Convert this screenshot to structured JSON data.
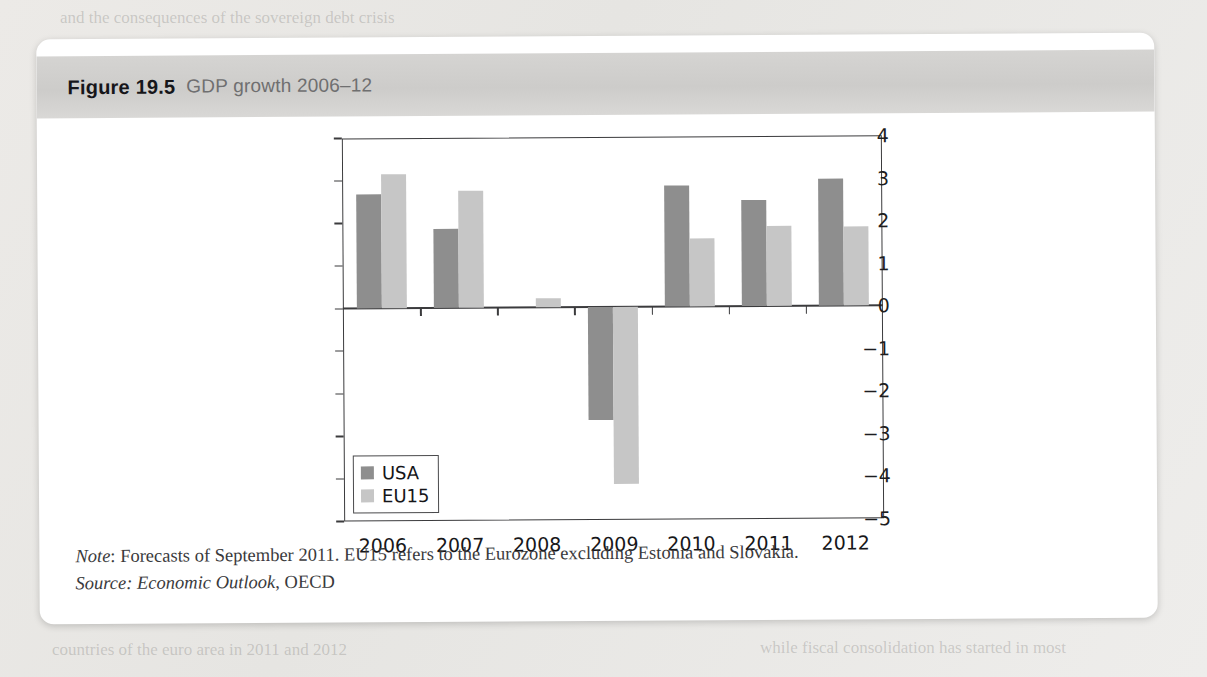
{
  "figure": {
    "number": "Figure 19.5",
    "caption": "GDP growth 2006–12"
  },
  "notes": {
    "note_label": "Note",
    "note_text": ": Forecasts of September 2011. EU15 refers to the Eurozone excluding Estonia and Slovakia.",
    "source_label": "Source",
    "source_text_italic": ": Economic Outlook",
    "source_text_plain": ", OECD"
  },
  "colors": {
    "usa": "#8e8e8e",
    "eu15": "#c6c6c6",
    "axis": "#3b3b3d",
    "header_band": "#d3d2d0",
    "card": "#ffffff",
    "page": "#e9e8e6"
  },
  "chart_data": {
    "type": "bar",
    "title": "GDP growth 2006–12",
    "xlabel": "",
    "ylabel": "",
    "categories": [
      "2006",
      "2007",
      "2008",
      "2009",
      "2010",
      "2011",
      "2012"
    ],
    "series": [
      {
        "name": "USA",
        "color": "#8e8e8e",
        "values": [
          2.68,
          1.87,
          0.0,
          -2.65,
          2.86,
          2.5,
          2.98
        ]
      },
      {
        "name": "EU15",
        "color": "#c6c6c6",
        "values": [
          3.15,
          2.75,
          0.22,
          -4.15,
          1.6,
          1.88,
          1.85
        ]
      }
    ],
    "yticks": [
      4,
      3,
      2,
      1,
      0,
      -1,
      -2,
      -3,
      -4,
      -5
    ],
    "ytick_labels": [
      "4",
      "3",
      "2",
      "1",
      "0",
      "−1",
      "−2",
      "−3",
      "−4",
      "−5"
    ],
    "ylim": [
      -5,
      4
    ],
    "grid": false,
    "legend": {
      "position": "bottom-left",
      "entries": [
        "USA",
        "EU15"
      ]
    }
  },
  "ghost_text": {
    "l1": "and the consequences of the sovereign debt crisis",
    "l2": "Federal Reserve and the Bank of England have",
    "l3": "considerable uncertainty about the recovery path",
    "l4": "the euro area has been hit hard by the crisis",
    "l5": "growth and the unemployment rate remained high",
    "l6": "monetary policy has been loosened considerably",
    "l7": "while fiscal consolidation has started in most",
    "l8": "countries of the euro area in 2011 and 2012"
  }
}
